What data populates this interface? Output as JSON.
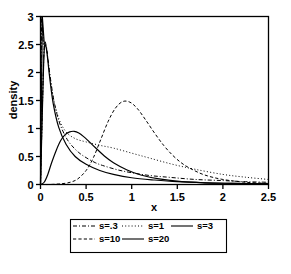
{
  "chart_data": {
    "type": "line",
    "title": "",
    "subtitle": "",
    "xlabel": "x",
    "ylabel": "density",
    "xlim": [
      0,
      2.5
    ],
    "ylim": [
      0,
      3
    ],
    "grid": false,
    "legend_position": "bottom-outside",
    "xticks": [
      "0",
      "0.5",
      "1",
      "1.5",
      "2",
      "2.5"
    ],
    "xtick_values": [
      0,
      0.5,
      1,
      1.5,
      2,
      2.5
    ],
    "yticks": [
      "0",
      "0.5",
      "1",
      "1.5",
      "2",
      "2.5",
      "3"
    ],
    "ytick_values": [
      0,
      0.5,
      1,
      1.5,
      2,
      2.5,
      3
    ],
    "series": [
      {
        "name": "s=.3",
        "style": "dashdot",
        "x": [
          0.0,
          0.02,
          0.04,
          0.06,
          0.08,
          0.1,
          0.14,
          0.18,
          0.22,
          0.28,
          0.34,
          0.42,
          0.5,
          0.6,
          0.7,
          0.85,
          1.0,
          1.2,
          1.4,
          1.7,
          2.0,
          2.25,
          2.5
        ],
        "y": [
          0.0,
          1.35,
          2.45,
          2.5,
          2.28,
          2.0,
          1.56,
          1.26,
          1.05,
          0.84,
          0.7,
          0.57,
          0.48,
          0.39,
          0.33,
          0.26,
          0.21,
          0.16,
          0.13,
          0.09,
          0.07,
          0.05,
          0.04
        ]
      },
      {
        "name": "s=1",
        "style": "dotted",
        "x": [
          0.0,
          0.02,
          0.04,
          0.06,
          0.08,
          0.1,
          0.14,
          0.2,
          0.28,
          0.38,
          0.5,
          0.65,
          0.8,
          1.0,
          1.2,
          1.45,
          1.7,
          2.0,
          2.25,
          2.5
        ],
        "y": [
          0.0,
          1.3,
          2.4,
          2.48,
          2.25,
          1.98,
          1.55,
          1.18,
          0.94,
          0.82,
          0.76,
          0.7,
          0.65,
          0.56,
          0.47,
          0.36,
          0.27,
          0.18,
          0.13,
          0.09
        ]
      },
      {
        "name": "s=3",
        "style": "solid",
        "x": [
          0.0,
          0.02,
          0.04,
          0.06,
          0.08,
          0.1,
          0.14,
          0.2,
          0.28,
          0.38,
          0.5,
          0.65,
          0.8,
          1.0,
          1.25,
          1.5,
          1.8,
          2.1,
          2.5
        ],
        "y": [
          0.0,
          1.28,
          2.38,
          2.46,
          2.22,
          1.92,
          1.44,
          1.02,
          0.72,
          0.5,
          0.36,
          0.25,
          0.18,
          0.12,
          0.08,
          0.05,
          0.03,
          0.02,
          0.01
        ]
      },
      {
        "name": "s=10",
        "style": "dashed",
        "x": [
          0.0,
          0.1,
          0.2,
          0.3,
          0.4,
          0.5,
          0.58,
          0.66,
          0.74,
          0.82,
          0.9,
          0.98,
          1.06,
          1.15,
          1.25,
          1.35,
          1.45,
          1.55,
          1.65,
          1.8,
          2.0,
          2.25,
          2.5
        ],
        "y": [
          0.0,
          0.0,
          0.01,
          0.03,
          0.09,
          0.25,
          0.48,
          0.8,
          1.12,
          1.36,
          1.48,
          1.47,
          1.36,
          1.16,
          0.92,
          0.7,
          0.52,
          0.38,
          0.28,
          0.17,
          0.09,
          0.04,
          0.02
        ]
      },
      {
        "name": "s=20",
        "style": "solid",
        "x": [
          0.0,
          0.04,
          0.08,
          0.12,
          0.17,
          0.22,
          0.27,
          0.32,
          0.37,
          0.42,
          0.47,
          0.53,
          0.6,
          0.7,
          0.8,
          0.95,
          1.1,
          1.3,
          1.55,
          1.8,
          2.1,
          2.5
        ],
        "y": [
          0.0,
          0.04,
          0.18,
          0.38,
          0.6,
          0.78,
          0.89,
          0.94,
          0.95,
          0.92,
          0.86,
          0.77,
          0.66,
          0.51,
          0.39,
          0.26,
          0.17,
          0.1,
          0.05,
          0.03,
          0.02,
          0.01
        ]
      }
    ],
    "legend_entries": [
      {
        "label": "s=.3",
        "style": "dashdot"
      },
      {
        "label": "s=1",
        "style": "dotted"
      },
      {
        "label": "s=3",
        "style": "solid"
      },
      {
        "label": "s=10",
        "style": "dashed"
      },
      {
        "label": "s=20",
        "style": "solid"
      }
    ]
  }
}
